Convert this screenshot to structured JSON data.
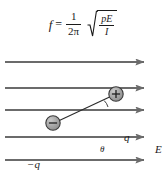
{
  "figure": {
    "background_color": "#ffffff",
    "ink_color": "#1a1a1a",
    "line_color": "#6b6b6b",
    "charge_fill": "#9a9a9a"
  },
  "formula": {
    "lhs": "f",
    "equals": "=",
    "fraction": {
      "numerator": "1",
      "denominator": "2π"
    },
    "radical_symbol": "√",
    "radicand": {
      "numerator": "pE",
      "denominator": "I"
    },
    "plain_text": "f = (1/2π) √(pE/I)"
  },
  "diagram": {
    "field_label": "E",
    "positive_charge_label": "q",
    "positive_charge_sign": "+",
    "negative_charge_label": "−q",
    "negative_charge_sign": "−",
    "angle_label": "θ",
    "field_line_count": 5,
    "field_line_direction": "right"
  }
}
